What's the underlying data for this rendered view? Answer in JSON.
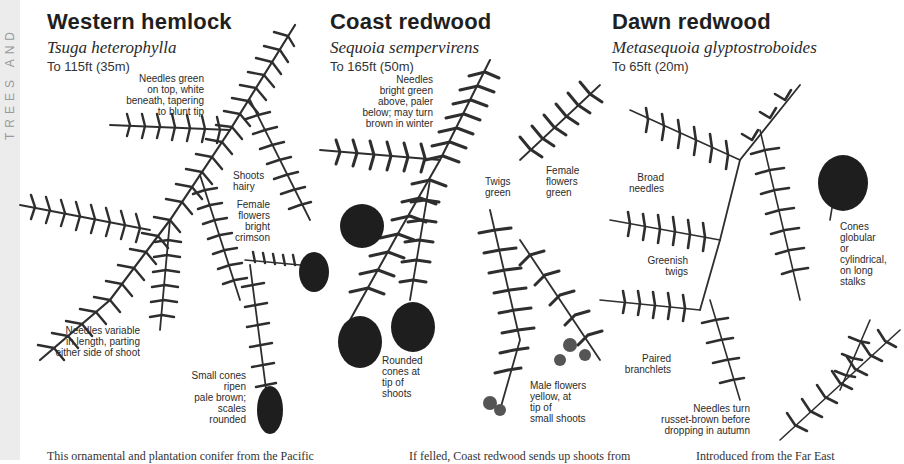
{
  "page": {
    "side_label": "TREES AND",
    "side_strip_color": "#ececec",
    "illustration_color": "#2e2e2e",
    "cone_color": "#1e1e1e"
  },
  "species": [
    {
      "common_name": "Western hemlock",
      "latin_name": "Tsuga heterophylla",
      "height": "To 115ft (35m)",
      "annotations": [
        "Needles green\non top, white\nbeneath, tapering\nto blunt tip",
        "Shoots\nhairy",
        "Female\nflowers\nbright\ncrimson",
        "Needles variable\nin length, parting\neither side of shoot",
        "Small cones\nripen\npale brown;\nscales\nrounded"
      ],
      "body_text": "This ornamental and plantation conifer from the Pacific"
    },
    {
      "common_name": "Coast redwood",
      "latin_name": "Sequoia sempervirens",
      "height": "To 165ft (50m)",
      "annotations": [
        "Needles\nbright green\nabove, paler\nbelow; may turn\nbrown in winter",
        "Twigs\ngreen",
        "Female\nflowers\ngreen",
        "Rounded\ncones at\ntip of\nshoots",
        "Male flowers\nyellow, at\ntip of\nsmall shoots"
      ],
      "body_text": "If felled, Coast redwood sends up shoots from"
    },
    {
      "common_name": "Dawn redwood",
      "latin_name": "Metasequoia glyptostroboides",
      "height": "To 65ft (20m)",
      "annotations": [
        "Broad\nneedles",
        "Cones\nglobular\nor\ncylindrical,\non long\nstalks",
        "Greenish\ntwigs",
        "Paired\nbranchlets",
        "Needles turn\nrusset-brown before\ndropping in autumn"
      ],
      "body_text": "Introduced from the Far East"
    }
  ]
}
